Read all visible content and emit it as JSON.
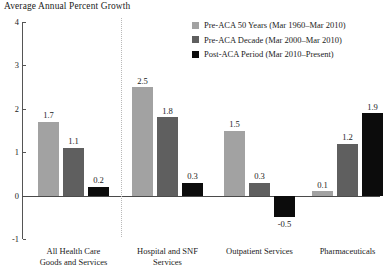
{
  "chart_data": {
    "type": "bar",
    "title": "Average Annual Percent Growth",
    "xlabel": "",
    "ylabel": "",
    "ylim": [
      -1,
      4
    ],
    "yticks": [
      4,
      3,
      2,
      1,
      0,
      -1
    ],
    "ytick_labels": [
      "4",
      "3",
      "2",
      "1",
      "0",
      "-1"
    ],
    "grid": false,
    "legend_position": "top-right",
    "categories": [
      "All Health Care Goods and Services",
      "Hospital and SNF Services",
      "Outpatient Services",
      "Pharmaceuticals"
    ],
    "category_lines": [
      [
        "All Health Care",
        "Goods and Services"
      ],
      [
        "Hospital and SNF",
        "Services"
      ],
      [
        "Outpatient Services"
      ],
      [
        "Pharmaceuticals"
      ]
    ],
    "series": [
      {
        "name": "Pre-ACA 50 Years (Mar 1960–Mar 2010)",
        "color": "#a2a2a2",
        "values": [
          1.7,
          2.5,
          1.5,
          0.1
        ],
        "labels": [
          "1.7",
          "2.5",
          "1.5",
          "0.1"
        ]
      },
      {
        "name": "Pre-ACA Decade (Mar 2000–Mar 2010)",
        "color": "#5f5f5f",
        "values": [
          1.1,
          1.8,
          0.3,
          1.2
        ],
        "labels": [
          "1.1",
          "1.8",
          "0.3",
          "1.2"
        ]
      },
      {
        "name": "Post-ACA Period (Mar 2010–Present)",
        "color": "#0c0c0c",
        "values": [
          0.2,
          0.3,
          -0.5,
          1.9
        ],
        "labels": [
          "0.2",
          "0.3",
          "-0.5",
          "1.9"
        ]
      }
    ],
    "annotations": {
      "divider_after_category_index": 0
    }
  },
  "legend": {
    "items": [
      {
        "label": "Pre-ACA 50 Years (Mar 1960–Mar 2010)",
        "color": "#a2a2a2"
      },
      {
        "label": "Pre-ACA Decade (Mar 2000–Mar 2010)",
        "color": "#5f5f5f"
      },
      {
        "label": "Post-ACA Period (Mar 2010–Present)",
        "color": "#0c0c0c"
      }
    ]
  }
}
